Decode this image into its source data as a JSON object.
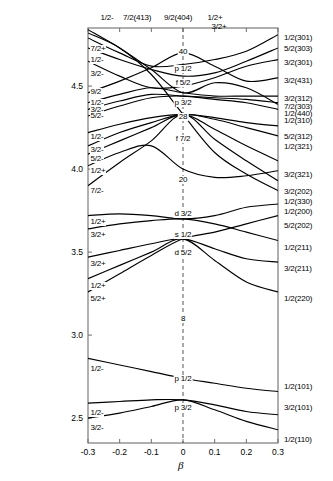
{
  "figure": {
    "kind": "nilsson-diagram",
    "xlabel": "β",
    "plot_box": {
      "left": 88,
      "right": 278,
      "top": 28,
      "bottom": 443
    }
  },
  "axes": {
    "x_ticks": [
      {
        "value": -0.3,
        "label": "-0.3"
      },
      {
        "value": -0.2,
        "label": "-0.2"
      },
      {
        "value": -0.1,
        "label": "-0.1"
      },
      {
        "value": 0.0,
        "label": "0"
      },
      {
        "value": 0.1,
        "label": "0.1"
      },
      {
        "value": 0.2,
        "label": "0.2"
      },
      {
        "value": 0.3,
        "label": "0.3"
      }
    ],
    "y_ticks": [
      {
        "value": 4.5,
        "label": "4.5"
      },
      {
        "value": 4.0,
        "label": "4.0"
      },
      {
        "value": 3.5,
        "label": "3.5"
      },
      {
        "value": 3.0,
        "label": "3.0"
      },
      {
        "value": 2.5,
        "label": "2.5"
      }
    ],
    "xlim": [
      -0.3,
      0.3
    ],
    "ylim": [
      2.35,
      4.85
    ]
  },
  "top_labels": [
    {
      "text": "1/2-",
      "x": 107
    },
    {
      "text": "7/2(413)",
      "x": 137
    },
    {
      "text": "9/2(404)",
      "x": 178
    },
    {
      "text": "1/2+",
      "x": 215
    },
    {
      "text": "3/2+",
      "x": 219,
      "y": 23
    }
  ],
  "left_labels": [
    {
      "text": "7/2+",
      "y": 45
    },
    {
      "text": "1/2-",
      "y": 56
    },
    {
      "text": "3/2-",
      "y": 70
    },
    {
      "text": "9/2",
      "y": 88
    },
    {
      "text": "1/2-",
      "y": 99
    },
    {
      "text": "3/2-",
      "y": 106
    },
    {
      "text": "5/2-",
      "y": 112
    },
    {
      "text": "1/2-",
      "y": 133
    },
    {
      "text": "3/2-",
      "y": 146
    },
    {
      "text": "5/2-",
      "y": 155
    },
    {
      "text": "1/2+",
      "y": 167
    },
    {
      "text": "7/2-",
      "y": 187
    },
    {
      "text": "1/2+",
      "y": 218
    },
    {
      "text": "3/2+",
      "y": 231
    },
    {
      "text": "3/2+",
      "y": 260
    },
    {
      "text": "1/2+",
      "y": 282
    },
    {
      "text": "5/2+",
      "y": 295
    },
    {
      "text": "1/2-",
      "y": 365
    },
    {
      "text": "1/2-",
      "y": 409
    },
    {
      "text": "3/2-",
      "y": 424
    }
  ],
  "right_labels": [
    {
      "text": "1/2(301)",
      "y": 34
    },
    {
      "text": "5/2(303)",
      "y": 45
    },
    {
      "text": "3/2(301)",
      "y": 59
    },
    {
      "text": "3/2(431)",
      "y": 77
    },
    {
      "text": "3/2(312)",
      "y": 95
    },
    {
      "text": "7/2(303)",
      "y": 103
    },
    {
      "text": "1/2(440)",
      "y": 110
    },
    {
      "text": "1/2(310)",
      "y": 117
    },
    {
      "text": "5/2(312)",
      "y": 133
    },
    {
      "text": "1/2(321)",
      "y": 143
    },
    {
      "text": "3/2(321)",
      "y": 171
    },
    {
      "text": "3/2(202)",
      "y": 188
    },
    {
      "text": "1/2(330)",
      "y": 198
    },
    {
      "text": "1/2(200)",
      "y": 208
    },
    {
      "text": "5/2(202)",
      "y": 222
    },
    {
      "text": "1/2(211)",
      "y": 244
    },
    {
      "text": "3/2(211)",
      "y": 265
    },
    {
      "text": "1/2(220)",
      "y": 295
    },
    {
      "text": "1/2(101)",
      "y": 383
    },
    {
      "text": "3/2(101)",
      "y": 404
    },
    {
      "text": "1/2(110)",
      "y": 436
    }
  ],
  "center_labels": [
    {
      "text": "40",
      "y": 48
    },
    {
      "text": "p 1/2",
      "y": 65
    },
    {
      "text": "f 5/2",
      "y": 79
    },
    {
      "text": "p 3/2",
      "y": 99
    },
    {
      "text": "28",
      "y": 113
    },
    {
      "text": "f 7/2",
      "y": 135
    },
    {
      "text": "20",
      "y": 176
    },
    {
      "text": "d 3/2",
      "y": 210
    },
    {
      "text": "s 1/2",
      "y": 231
    },
    {
      "text": "d 5/2",
      "y": 249
    },
    {
      "text": "8",
      "y": 315
    },
    {
      "text": "p 1/2",
      "y": 375
    },
    {
      "text": "p 3/2",
      "y": 404
    }
  ],
  "chart_data": {
    "type": "line",
    "title": "",
    "xlabel": "β",
    "ylabel": "",
    "xlim": [
      -0.3,
      0.3
    ],
    "ylim": [
      2.35,
      4.85
    ],
    "grid": false,
    "legend": "none",
    "note": "Nilsson single-particle energy levels vs deformation beta; shell gaps marked 8, 20, 28, 40; spherical orbital labels p1/2, f5/2, p3/2, f7/2, d3/2, s1/2, d5/2, p1/2, p3/2 at beta=0",
    "series": [
      {
        "name": "1/2(301)",
        "left_label": "7/2+",
        "top_label": "1/2-",
        "points": [
          [
            -0.3,
            4.79
          ],
          [
            -0.2,
            4.7
          ],
          [
            -0.1,
            4.62
          ],
          [
            0.0,
            4.63
          ],
          [
            0.1,
            4.66
          ],
          [
            0.2,
            4.71
          ],
          [
            0.3,
            4.81
          ]
        ]
      },
      {
        "name": "5/2(303)",
        "left_label": "1/2-",
        "points": [
          [
            -0.3,
            4.73
          ],
          [
            -0.2,
            4.66
          ],
          [
            -0.1,
            4.6
          ],
          [
            0.0,
            4.56
          ],
          [
            0.1,
            4.58
          ],
          [
            0.2,
            4.65
          ],
          [
            0.3,
            4.73
          ]
        ]
      },
      {
        "name": "3/2(301)",
        "left_label": "3/2-",
        "points": [
          [
            -0.3,
            4.65
          ],
          [
            -0.2,
            4.56
          ],
          [
            -0.1,
            4.49
          ],
          [
            0.0,
            4.5
          ],
          [
            0.1,
            4.55
          ],
          [
            0.2,
            4.62
          ],
          [
            0.3,
            4.66
          ]
        ]
      },
      {
        "name": "3/2(431)",
        "left_label": "9/2",
        "top_label": "7/2(413)",
        "points": [
          [
            -0.3,
            4.46
          ],
          [
            -0.2,
            4.53
          ],
          [
            -0.1,
            4.61
          ],
          [
            0.0,
            4.7
          ],
          [
            0.1,
            4.62
          ],
          [
            0.2,
            4.53
          ],
          [
            0.3,
            4.55
          ]
        ]
      },
      {
        "name": "3/2(312)",
        "left_label": "1/2-",
        "points": [
          [
            -0.3,
            4.4
          ],
          [
            -0.2,
            4.45
          ],
          [
            -0.1,
            4.49
          ],
          [
            0.0,
            4.46
          ],
          [
            0.1,
            4.44
          ],
          [
            0.2,
            4.44
          ],
          [
            0.3,
            4.44
          ]
        ]
      },
      {
        "name": "7/2(303)",
        "left_label": "3/2-",
        "points": [
          [
            -0.3,
            4.36
          ],
          [
            -0.2,
            4.41
          ],
          [
            -0.1,
            4.45
          ],
          [
            0.0,
            4.44
          ],
          [
            0.1,
            4.43
          ],
          [
            0.2,
            4.42
          ],
          [
            0.3,
            4.4
          ]
        ]
      },
      {
        "name": "1/2(440)",
        "top_label": "9/2(404)",
        "points": [
          [
            -0.3,
            4.84
          ],
          [
            -0.2,
            4.73
          ],
          [
            -0.1,
            4.6
          ],
          [
            0.0,
            4.46
          ],
          [
            0.1,
            4.52
          ],
          [
            0.2,
            4.49
          ],
          [
            0.3,
            4.39
          ]
        ]
      },
      {
        "name": "1/2(310)",
        "left_label": "5/2-",
        "points": [
          [
            -0.3,
            4.32
          ],
          [
            -0.2,
            4.38
          ],
          [
            -0.1,
            4.43
          ],
          [
            0.0,
            4.44
          ],
          [
            0.1,
            4.42
          ],
          [
            0.2,
            4.4
          ],
          [
            0.3,
            4.36
          ]
        ]
      },
      {
        "name": "5/2(312)",
        "left_label": "1/2-",
        "points": [
          [
            -0.3,
            4.22
          ],
          [
            -0.2,
            4.27
          ],
          [
            -0.1,
            4.31
          ],
          [
            0.0,
            4.33
          ],
          [
            0.1,
            4.31
          ],
          [
            0.2,
            4.28
          ],
          [
            0.3,
            4.26
          ]
        ]
      },
      {
        "name": "1/2(321)",
        "left_label": "3/2-",
        "points": [
          [
            -0.3,
            4.14
          ],
          [
            -0.2,
            4.22
          ],
          [
            -0.1,
            4.28
          ],
          [
            0.0,
            4.33
          ],
          [
            0.1,
            4.3
          ],
          [
            0.2,
            4.25
          ],
          [
            0.3,
            4.2
          ]
        ]
      },
      {
        "name": "3/2(321)",
        "left_label": "5/2-",
        "points": [
          [
            -0.3,
            4.09
          ],
          [
            -0.2,
            4.17
          ],
          [
            -0.1,
            4.25
          ],
          [
            0.0,
            4.33
          ],
          [
            0.1,
            4.24
          ],
          [
            0.2,
            4.14
          ],
          [
            0.3,
            4.05
          ]
        ]
      },
      {
        "name": "3/2(202)",
        "left_label": "1/2+",
        "top_label": "1/2+",
        "points": [
          [
            -0.3,
            4.02
          ],
          [
            -0.2,
            4.1
          ],
          [
            -0.1,
            4.14
          ],
          [
            0.0,
            4.0
          ],
          [
            0.1,
            3.95
          ],
          [
            0.2,
            3.96
          ],
          [
            0.3,
            3.99
          ]
        ]
      },
      {
        "name": "1/2(330)",
        "left_label": "7/2-",
        "points": [
          [
            -0.3,
            3.9
          ],
          [
            -0.2,
            4.04
          ],
          [
            -0.1,
            4.17
          ],
          [
            0.0,
            4.33
          ],
          [
            0.1,
            4.18
          ],
          [
            0.2,
            4.05
          ],
          [
            0.3,
            3.93
          ]
        ]
      },
      {
        "name": "1/2(200)",
        "top_label": "3/2+",
        "points": [
          [
            -0.3,
            4.82
          ],
          [
            -0.2,
            4.73
          ],
          [
            -0.1,
            4.57
          ],
          [
            0.0,
            4.33
          ],
          [
            0.1,
            4.1
          ],
          [
            0.2,
            3.97
          ],
          [
            0.3,
            3.87
          ]
        ]
      },
      {
        "name": "5/2(202)",
        "left_label": "1/2+",
        "points": [
          [
            -0.3,
            3.72
          ],
          [
            -0.2,
            3.73
          ],
          [
            -0.1,
            3.72
          ],
          [
            0.0,
            3.7
          ],
          [
            0.1,
            3.72
          ],
          [
            0.2,
            3.77
          ],
          [
            0.3,
            3.79
          ]
        ]
      },
      {
        "name": "1/2(211)",
        "left_label": "3/2+",
        "points": [
          [
            -0.3,
            3.64
          ],
          [
            -0.2,
            3.67
          ],
          [
            -0.1,
            3.69
          ],
          [
            0.0,
            3.7
          ],
          [
            0.1,
            3.67
          ],
          [
            0.2,
            3.62
          ],
          [
            0.3,
            3.57
          ]
        ]
      },
      {
        "name": "3/2(211)",
        "left_label": "3/2+",
        "points": [
          [
            -0.3,
            3.47
          ],
          [
            -0.2,
            3.51
          ],
          [
            -0.1,
            3.55
          ],
          [
            0.0,
            3.58
          ],
          [
            0.1,
            3.52
          ],
          [
            0.2,
            3.46
          ],
          [
            0.3,
            3.44
          ]
        ]
      },
      {
        "name": "1/2(220)",
        "left_label": "1/2+",
        "points": [
          [
            -0.3,
            3.34
          ],
          [
            -0.2,
            3.42
          ],
          [
            -0.1,
            3.5
          ],
          [
            0.0,
            3.58
          ],
          [
            0.1,
            3.45
          ],
          [
            0.2,
            3.32
          ],
          [
            0.3,
            3.26
          ]
        ]
      },
      {
        "name": "d5/2-low",
        "left_label": "5/2+",
        "points": [
          [
            -0.3,
            3.26
          ],
          [
            -0.2,
            3.37
          ],
          [
            -0.1,
            3.48
          ],
          [
            0.0,
            3.58
          ],
          [
            0.1,
            3.62
          ],
          [
            0.2,
            3.67
          ],
          [
            0.3,
            3.72
          ]
        ]
      },
      {
        "name": "1/2(101)",
        "left_label": "1/2-",
        "points": [
          [
            -0.3,
            2.86
          ],
          [
            -0.2,
            2.82
          ],
          [
            -0.1,
            2.78
          ],
          [
            0.0,
            2.74
          ],
          [
            0.1,
            2.71
          ],
          [
            0.2,
            2.68
          ],
          [
            0.3,
            2.66
          ]
        ]
      },
      {
        "name": "3/2(101)",
        "left_label": "1/2-",
        "points": [
          [
            -0.3,
            2.59
          ],
          [
            -0.2,
            2.6
          ],
          [
            -0.1,
            2.61
          ],
          [
            0.0,
            2.61
          ],
          [
            0.1,
            2.58
          ],
          [
            0.2,
            2.54
          ],
          [
            0.3,
            2.52
          ]
        ]
      },
      {
        "name": "1/2(110)",
        "left_label": "3/2-",
        "points": [
          [
            -0.3,
            2.5
          ],
          [
            -0.2,
            2.53
          ],
          [
            -0.1,
            2.57
          ],
          [
            0.0,
            2.61
          ],
          [
            0.1,
            2.55
          ],
          [
            0.2,
            2.48
          ],
          [
            0.3,
            2.43
          ]
        ]
      }
    ]
  }
}
